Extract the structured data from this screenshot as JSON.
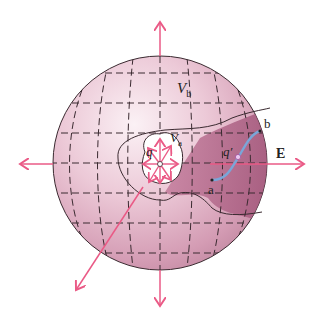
{
  "labels": {
    "outer_potential": "V",
    "outer_potential_sub": "b",
    "inner_potential": "V",
    "inner_potential_sub": "a",
    "source_charge": "q",
    "test_charge": "q′",
    "point_a": "a",
    "point_b": "b",
    "field": "E"
  },
  "colors": {
    "sphere_light": "#f8e6ee",
    "sphere_mid": "#e3b7c9",
    "sphere_dark": "#c98aa4",
    "region_dark": "#a95c7f",
    "arrow": "#ea5a86",
    "path": "#7aa6d8",
    "grid": "#3a2a30"
  }
}
